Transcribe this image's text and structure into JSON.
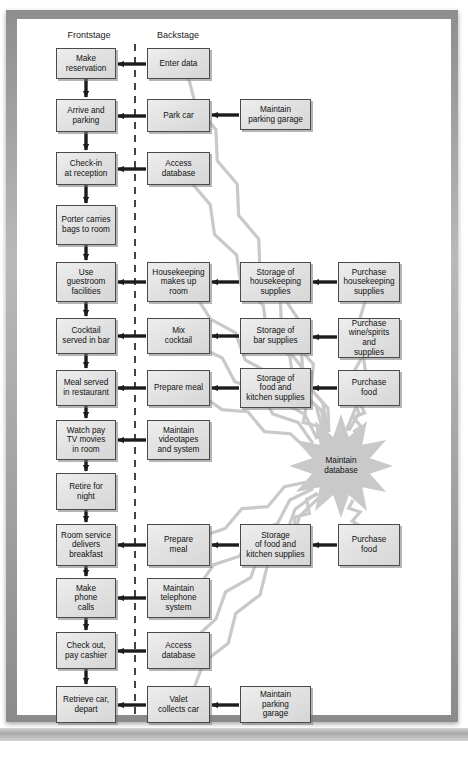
{
  "figure": {
    "bottom_caption": "",
    "divider_label": "line-of-visibility-dashed"
  },
  "columns": [
    {
      "id": "frontstage",
      "label": "Frontstage",
      "x": 57,
      "y": 30,
      "width": 64
    },
    {
      "id": "backstage",
      "label": "Backstage",
      "x": 146,
      "y": 30,
      "width": 64
    }
  ],
  "colors": {
    "box_fill": "#e4e4e4",
    "box_border": "#4a4a4a",
    "arrow_black": "#1c1c1c",
    "arrow_grey": "#c9c9c9",
    "burst_fill": "#c9c9c9",
    "divider": "#141414",
    "page_frame": "#9a9a9a"
  },
  "nodes": [
    {
      "id": "make-reservation",
      "label": "Make\nreservation",
      "x": 56,
      "y": 48,
      "w": 60,
      "h": 31
    },
    {
      "id": "enter-data",
      "label": "Enter data",
      "x": 147,
      "y": 48,
      "w": 63,
      "h": 31
    },
    {
      "id": "arrive-parking",
      "label": "Arrive and\nparking",
      "x": 56,
      "y": 99,
      "w": 60,
      "h": 33
    },
    {
      "id": "park-car",
      "label": "Park car",
      "x": 147,
      "y": 99,
      "w": 63,
      "h": 33
    },
    {
      "id": "maintain-parking-1",
      "label": "Maintain\nparking garage",
      "x": 240,
      "y": 99,
      "w": 71,
      "h": 31
    },
    {
      "id": "check-in",
      "label": "Check-in\nat reception",
      "x": 56,
      "y": 152,
      "w": 60,
      "h": 33
    },
    {
      "id": "access-database-1",
      "label": "Access\ndatabase",
      "x": 147,
      "y": 152,
      "w": 63,
      "h": 33
    },
    {
      "id": "porter-carries-bags",
      "label": "Porter carries\nbags to room",
      "x": 56,
      "y": 205,
      "w": 60,
      "h": 40
    },
    {
      "id": "use-guestroom",
      "label": "Use\nguestroom\nfacilities",
      "x": 56,
      "y": 262,
      "w": 60,
      "h": 40
    },
    {
      "id": "housekeeping",
      "label": "Housekeeping\nmakes up\nroom",
      "x": 147,
      "y": 262,
      "w": 63,
      "h": 40
    },
    {
      "id": "storage-housekeeping",
      "label": "Storage of\nhousekeeping\nsupplies",
      "x": 240,
      "y": 262,
      "w": 71,
      "h": 40
    },
    {
      "id": "purchase-housekeeping",
      "label": "Purchase\nhousekeeping\nsupplies",
      "x": 338,
      "y": 262,
      "w": 62,
      "h": 40
    },
    {
      "id": "cocktail-served",
      "label": "Cocktail\nserved in bar",
      "x": 56,
      "y": 318,
      "w": 60,
      "h": 36
    },
    {
      "id": "mix-cocktail",
      "label": "Mix\ncocktail",
      "x": 147,
      "y": 318,
      "w": 63,
      "h": 36
    },
    {
      "id": "storage-bar",
      "label": "Storage of\nbar supplies",
      "x": 240,
      "y": 318,
      "w": 71,
      "h": 36
    },
    {
      "id": "purchase-wine",
      "label": "Purchase\nwine/spirits and\nsupplies",
      "x": 338,
      "y": 318,
      "w": 62,
      "h": 40
    },
    {
      "id": "meal-served",
      "label": "Meal served\nin restaurant",
      "x": 56,
      "y": 370,
      "w": 60,
      "h": 36
    },
    {
      "id": "prepare-meal-1",
      "label": "Prepare meal",
      "x": 147,
      "y": 370,
      "w": 63,
      "h": 36
    },
    {
      "id": "storage-food-1",
      "label": "Storage of\nfood and\nkitchen supplies",
      "x": 240,
      "y": 368,
      "w": 71,
      "h": 40
    },
    {
      "id": "purchase-food-1",
      "label": "Purchase\nfood",
      "x": 338,
      "y": 370,
      "w": 62,
      "h": 36
    },
    {
      "id": "watch-pay-tv",
      "label": "Watch pay\nTV movies\nin room",
      "x": 56,
      "y": 420,
      "w": 60,
      "h": 40
    },
    {
      "id": "maintain-videotapes",
      "label": "Maintain\nvideotapes\nand system",
      "x": 147,
      "y": 420,
      "w": 63,
      "h": 40
    },
    {
      "id": "retire-for-night",
      "label": "Retire for\nnight",
      "x": 56,
      "y": 473,
      "w": 60,
      "h": 37
    },
    {
      "id": "room-service",
      "label": "Room service\ndelivers\nbreakfast",
      "x": 56,
      "y": 524,
      "w": 60,
      "h": 42
    },
    {
      "id": "prepare-meal-2",
      "label": "Prepare\nmeal",
      "x": 147,
      "y": 524,
      "w": 63,
      "h": 42
    },
    {
      "id": "storage-food-2",
      "label": "Storage\nof food and\nkitchen supplies",
      "x": 240,
      "y": 524,
      "w": 71,
      "h": 42
    },
    {
      "id": "purchase-food-2",
      "label": "Purchase\nfood",
      "x": 338,
      "y": 524,
      "w": 62,
      "h": 42
    },
    {
      "id": "make-phone-calls",
      "label": "Make\nphone\ncalls",
      "x": 56,
      "y": 578,
      "w": 60,
      "h": 40
    },
    {
      "id": "maintain-telephone",
      "label": "Maintain\ntelephone\nsystem",
      "x": 147,
      "y": 578,
      "w": 63,
      "h": 40
    },
    {
      "id": "check-out",
      "label": "Check out,\npay cashier",
      "x": 56,
      "y": 632,
      "w": 60,
      "h": 37
    },
    {
      "id": "access-database-2",
      "label": "Access\ndatabase",
      "x": 147,
      "y": 632,
      "w": 63,
      "h": 37
    },
    {
      "id": "retrieve-car",
      "label": "Retrieve car,\ndepart",
      "x": 56,
      "y": 686,
      "w": 60,
      "h": 37
    },
    {
      "id": "valet-collects-car",
      "label": "Valet\ncollects car",
      "x": 147,
      "y": 686,
      "w": 63,
      "h": 37
    },
    {
      "id": "maintain-parking-2",
      "label": "Maintain\nparking\ngarage",
      "x": 240,
      "y": 686,
      "w": 71,
      "h": 37
    }
  ],
  "starburst": {
    "id": "maintain-database",
    "label": "Maintain\ndatabase",
    "cx": 341,
    "cy": 466,
    "r_outer": 52,
    "r_inner": 30,
    "points": 12
  },
  "flow_arrows_vertical": [
    {
      "from": "make-reservation",
      "to": "arrive-parking"
    },
    {
      "from": "arrive-parking",
      "to": "check-in"
    },
    {
      "from": "check-in",
      "to": "porter-carries-bags"
    },
    {
      "from": "porter-carries-bags",
      "to": "use-guestroom"
    },
    {
      "from": "use-guestroom",
      "to": "cocktail-served"
    },
    {
      "from": "cocktail-served",
      "to": "meal-served"
    },
    {
      "from": "meal-served",
      "to": "watch-pay-tv"
    },
    {
      "from": "watch-pay-tv",
      "to": "retire-for-night"
    },
    {
      "from": "retire-for-night",
      "to": "room-service"
    },
    {
      "from": "room-service",
      "to": "make-phone-calls"
    },
    {
      "from": "make-phone-calls",
      "to": "check-out"
    },
    {
      "from": "check-out",
      "to": "retrieve-car"
    }
  ],
  "support_arrows_horizontal": [
    {
      "from": "enter-data",
      "to": "make-reservation"
    },
    {
      "from": "park-car",
      "to": "arrive-parking"
    },
    {
      "from": "maintain-parking-1",
      "to": "park-car"
    },
    {
      "from": "access-database-1",
      "to": "check-in"
    },
    {
      "from": "housekeeping",
      "to": "use-guestroom"
    },
    {
      "from": "storage-housekeeping",
      "to": "housekeeping"
    },
    {
      "from": "purchase-housekeeping",
      "to": "storage-housekeeping"
    },
    {
      "from": "mix-cocktail",
      "to": "cocktail-served"
    },
    {
      "from": "storage-bar",
      "to": "mix-cocktail"
    },
    {
      "from": "purchase-wine",
      "to": "storage-bar"
    },
    {
      "from": "prepare-meal-1",
      "to": "meal-served"
    },
    {
      "from": "storage-food-1",
      "to": "prepare-meal-1"
    },
    {
      "from": "purchase-food-1",
      "to": "storage-food-1"
    },
    {
      "from": "maintain-videotapes",
      "to": "watch-pay-tv"
    },
    {
      "from": "prepare-meal-2",
      "to": "room-service"
    },
    {
      "from": "storage-food-2",
      "to": "prepare-meal-2"
    },
    {
      "from": "purchase-food-2",
      "to": "storage-food-2"
    },
    {
      "from": "maintain-telephone",
      "to": "make-phone-calls"
    },
    {
      "from": "access-database-2",
      "to": "check-out"
    },
    {
      "from": "valet-collects-car",
      "to": "retrieve-car"
    },
    {
      "from": "maintain-parking-2",
      "to": "valet-collects-car"
    }
  ],
  "database_links": [
    "enter-data",
    "access-database-1",
    "housekeeping",
    "storage-housekeeping",
    "purchase-housekeeping",
    "mix-cocktail",
    "storage-bar",
    "purchase-wine",
    "prepare-meal-1",
    "storage-food-1",
    "purchase-food-1",
    "prepare-meal-2",
    "storage-food-2",
    "purchase-food-2",
    "maintain-telephone",
    "access-database-2",
    "valet-collects-car"
  ]
}
